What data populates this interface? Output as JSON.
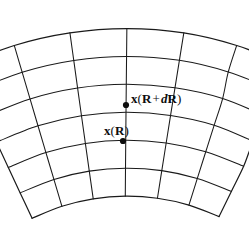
{
  "figure": {
    "name": "curvilinear-annular-sector-mesh",
    "background_color": "#ffffff",
    "line_color": "#1a1a1a",
    "line_width": 1.05,
    "width": 249,
    "height": 226,
    "geometry": {
      "type": "annular-sector",
      "center_x": 126,
      "center_y": 412,
      "inner_radius": 215,
      "outer_radius": 382,
      "start_angle_deg": -115.5,
      "end_angle_deg": -64.5,
      "angular_divisions": 6,
      "radial_divisions": 6,
      "jitter": 1.4
    }
  },
  "labels": [
    {
      "id": "outer-point-label",
      "prefix": "x",
      "open": "(",
      "base": "R",
      "operator": "+",
      "differential": "d",
      "variable": "R",
      "close": ")",
      "text": "x(R + dR)"
    },
    {
      "id": "inner-point-label",
      "prefix": "x",
      "open": "(",
      "base": "R",
      "close": ")",
      "text": "x(R)"
    }
  ],
  "points": [
    {
      "id": "outer-point",
      "label_ref": "x(R + dR)",
      "x": 126,
      "y": 105,
      "radius": 3.1,
      "color": "#0d0d0d"
    },
    {
      "id": "inner-point",
      "label_ref": "x(R)",
      "x": 123,
      "y": 141,
      "radius": 3.1,
      "color": "#0d0d0d"
    }
  ]
}
